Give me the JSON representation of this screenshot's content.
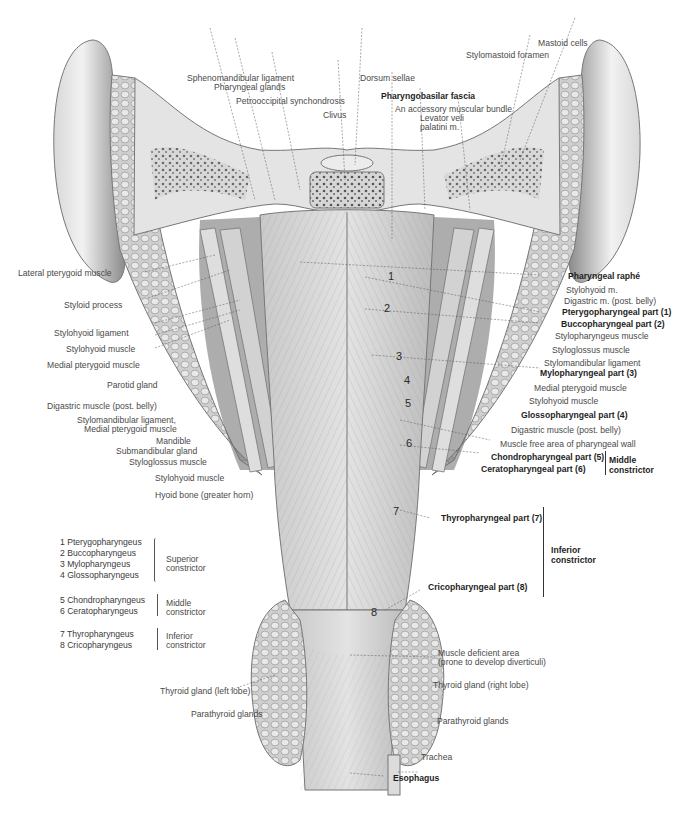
{
  "figure": {
    "colors": {
      "ink": "#2a2a2a",
      "tissue_light": "#e8e8e8",
      "tissue_mid": "#bdbdbd",
      "tissue_dark": "#6e6e6e",
      "background": "#ffffff"
    }
  },
  "labels": {
    "top": {
      "sphenomandibular_ligament": "Sphenomandibular ligament",
      "pharyngeal_glands": "Pharyngeal glands",
      "petrooccipital_synchondrosis": "Petrooccipital synchondrosis",
      "clivus": "Clivus",
      "dorsum_sellae": "Dorsum sellae",
      "pharyngobasilar_fascia": "Pharyngobasilar fascia",
      "accessory_bundle": "An accessory muscular bundle",
      "levator_veli_1": "Levator veli",
      "levator_veli_2": "palatini m.",
      "stylomastoid_foramen": "Stylomastoid foramen",
      "mastoid_cells": "Mastoid cells"
    },
    "left": {
      "lateral_pterygoid": "Lateral pterygoid muscle",
      "styloid_process": "Styloid process",
      "stylohyoid_ligament": "Stylohyoid ligament",
      "stylohyoid_muscle": "Stylohyoid muscle",
      "medial_pterygoid": "Medial pterygoid muscle",
      "parotid_gland": "Parotid gland",
      "digastric": "Digastric muscle (post. belly)",
      "stylomandibular_1": "Stylomandibular ligament,",
      "stylomandibular_2": "Medial pterygoid muscle",
      "mandible": "Mandible",
      "submandibular": "Submandibular gland",
      "styloglossus": "Styloglossus muscle",
      "stylohyoid_muscle_2": "Stylohyoid muscle",
      "hyoid": "Hyoid bone (greater horn)"
    },
    "right": {
      "pharyngeal_raphe": "Pharyngeal raphé",
      "stylohyoid_m": "Stylohyoid m.",
      "digastric_m": "Digastric m. (post. belly)",
      "pterygopharyngeal": "Pterygopharyngeal part (1)",
      "buccopharyngeal": "Buccopharyngeal part (2)",
      "stylopharyngeus": "Stylopharyngeus muscle",
      "styloglossus": "Styloglossus muscle",
      "stylomandibular": "Stylomandibular ligament",
      "mylopharyngeal": "Mylopharyngeal part (3)",
      "medial_pterygoid": "Medial pterygoid muscle",
      "stylohyoid_muscle": "Stylohyoid muscle",
      "glossopharyngeal": "Glossopharyngeal part (4)",
      "digastric_muscle": "Digastric muscle (post. belly)",
      "muscle_free_area": "Muscle free area of pharyngeal wall",
      "chondropharyngeal": "Chondropharyngeal part (5)",
      "ceratopharyngeal": "Ceratopharyngeal part (6)",
      "middle_constrictor_1": "Middle",
      "middle_constrictor_2": "constrictor",
      "thyropharyngeal": "Thyropharyngeal part (7)",
      "cricopharyngeal": "Cricopharyngeal part (8)",
      "inferior_constrictor_1": "Inferior",
      "inferior_constrictor_2": "constrictor"
    },
    "bottom": {
      "muscle_deficient_1": "Muscle deficient area",
      "muscle_deficient_2": "(prone to develop diverticuli)",
      "thyroid_right": "Thyroid gland (right lobe)",
      "thyroid_left": "Thyroid gland (left lobe)",
      "parathyroid_left": "Parathyroid glands",
      "parathyroid_right": "Parathyroid glands",
      "trachea": "Trachea",
      "esophagus": "Esophagus"
    }
  },
  "numbers": [
    "1",
    "2",
    "3",
    "4",
    "5",
    "6",
    "7",
    "8"
  ],
  "legend": {
    "groups": [
      {
        "items": [
          "1 Pterygopharyngeus",
          "2 Buccopharyngeus",
          "3 Mylopharyngeus",
          "4 Glossopharyngeus"
        ],
        "label_1": "Superior",
        "label_2": "constrictor"
      },
      {
        "items": [
          "5 Chondropharyngeus",
          "6 Ceratopharyngeus"
        ],
        "label_1": "Middle",
        "label_2": "constrictor"
      },
      {
        "items": [
          "7 Thyropharyngeus",
          "8 Cricopharyngeus"
        ],
        "label_1": "Inferior",
        "label_2": "constrictor"
      }
    ]
  }
}
